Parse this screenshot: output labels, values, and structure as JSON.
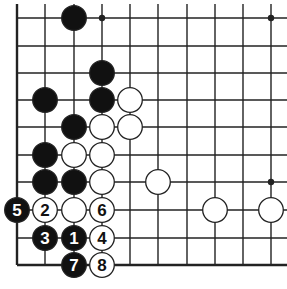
{
  "diagram": {
    "type": "go-board-fragment",
    "grid": {
      "x": [
        17,
        45,
        74,
        102,
        130,
        158,
        187,
        215,
        243,
        271
      ],
      "y": [
        18,
        46,
        73,
        100,
        127,
        155,
        182,
        210,
        238,
        265
      ],
      "edges": [
        "left",
        "bottom"
      ]
    },
    "star_points": [
      [
        3,
        0
      ],
      [
        9,
        0
      ],
      [
        9,
        6
      ]
    ],
    "stones": [
      {
        "color": "black",
        "col": 2,
        "row": 0,
        "label": ""
      },
      {
        "color": "black",
        "col": 3,
        "row": 2,
        "label": ""
      },
      {
        "color": "black",
        "col": 3,
        "row": 3,
        "label": ""
      },
      {
        "color": "black",
        "col": 1,
        "row": 3,
        "label": ""
      },
      {
        "color": "black",
        "col": 2,
        "row": 4,
        "label": ""
      },
      {
        "color": "black",
        "col": 1,
        "row": 5,
        "label": ""
      },
      {
        "color": "black",
        "col": 1,
        "row": 6,
        "label": ""
      },
      {
        "color": "black",
        "col": 2,
        "row": 6,
        "label": ""
      },
      {
        "color": "white",
        "col": 4,
        "row": 3,
        "label": ""
      },
      {
        "color": "white",
        "col": 3,
        "row": 4,
        "label": ""
      },
      {
        "color": "white",
        "col": 4,
        "row": 4,
        "label": ""
      },
      {
        "color": "white",
        "col": 2,
        "row": 5,
        "label": ""
      },
      {
        "color": "white",
        "col": 3,
        "row": 5,
        "label": ""
      },
      {
        "color": "white",
        "col": 3,
        "row": 6,
        "label": ""
      },
      {
        "color": "white",
        "col": 5,
        "row": 6,
        "label": ""
      },
      {
        "color": "white",
        "col": 7,
        "row": 7,
        "label": ""
      },
      {
        "color": "white",
        "col": 9,
        "row": 7,
        "label": ""
      },
      {
        "color": "white",
        "col": 2,
        "row": 7,
        "label": ""
      },
      {
        "color": "black",
        "col": 0,
        "row": 7,
        "label": "5"
      },
      {
        "color": "white",
        "col": 1,
        "row": 7,
        "label": "2"
      },
      {
        "color": "white",
        "col": 3,
        "row": 7,
        "label": "6"
      },
      {
        "color": "black",
        "col": 1,
        "row": 8,
        "label": "3"
      },
      {
        "color": "black",
        "col": 2,
        "row": 8,
        "label": "1"
      },
      {
        "color": "white",
        "col": 3,
        "row": 8,
        "label": "4"
      },
      {
        "color": "black",
        "col": 2,
        "row": 9,
        "label": "7"
      },
      {
        "color": "white",
        "col": 3,
        "row": 9,
        "label": "8"
      }
    ],
    "colors": {
      "line": "#222222",
      "black": "#111111",
      "white": "#ffffff"
    }
  }
}
